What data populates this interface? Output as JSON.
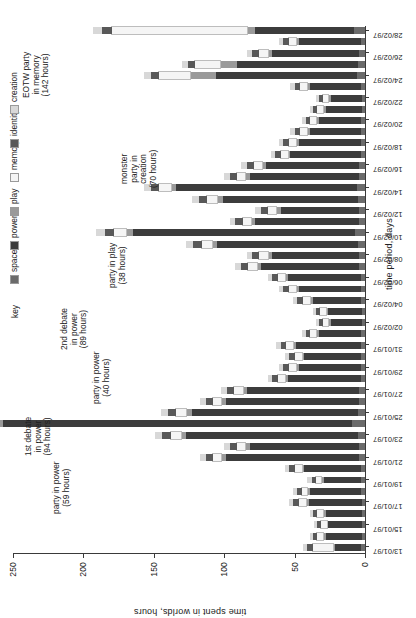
{
  "chart_data": {
    "type": "bar",
    "subtype": "stacked-bar",
    "orientation": "vertical-bars-rotated-page",
    "title": "",
    "xlabel": "time period, days",
    "ylabel": "time spent in worlds, hours",
    "ylim": [
      0,
      250
    ],
    "yticks": [
      0,
      50,
      100,
      150,
      200,
      250
    ],
    "grid": false,
    "legend_title": "key",
    "legend_position": "top-left-of-plot",
    "series": [
      {
        "name": "space",
        "color": "#6b6b6b"
      },
      {
        "name": "power",
        "color": "#3c3c3c"
      },
      {
        "name": "play",
        "color": "#9a9a9a"
      },
      {
        "name": "memory",
        "color": "#f5f5f5"
      },
      {
        "name": "identity",
        "color": "#585858"
      },
      {
        "name": "creation",
        "color": "#d8d8d8"
      }
    ],
    "categories": [
      "13/01/97",
      "14/01/97",
      "15/01/97",
      "16/01/97",
      "17/01/97",
      "18/01/97",
      "19/01/97",
      "20/01/97",
      "21/01/97",
      "22/01/97",
      "23/01/97",
      "24/01/97",
      "25/01/97",
      "26/01/97",
      "27/01/97",
      "28/01/97",
      "29/01/97",
      "30/01/97",
      "31/01/97",
      "01/02/97",
      "02/02/97",
      "03/02/97",
      "04/02/97",
      "05/02/97",
      "06/02/97",
      "07/02/97",
      "08/02/97",
      "09/02/97",
      "10/02/97",
      "11/02/97",
      "12/02/97",
      "13/02/97",
      "14/02/97",
      "15/02/97",
      "16/02/97",
      "17/02/97",
      "18/02/97",
      "19/02/97",
      "20/02/97",
      "21/02/97",
      "22/02/97",
      "23/02/97",
      "24/02/97",
      "25/02/97",
      "26/02/97",
      "27/02/97",
      "28/02/97"
    ],
    "tick_labels": [
      "13/01/97",
      "15/01/97",
      "17/01/97",
      "19/01/97",
      "21/01/97",
      "23/01/97",
      "25/01/97",
      "27/01/97",
      "29/01/97",
      "31/01/97",
      "02/02/97",
      "04/02/97",
      "06/02/97",
      "08/02/97",
      "10/02/97",
      "12/02/97",
      "14/02/97",
      "16/02/97",
      "18/02/97",
      "20/02/97",
      "22/02/97",
      "24/02/97",
      "26/02/97",
      "28/02/97"
    ],
    "tick_every": 2,
    "values": [
      [
        3,
        18,
        2,
        14,
        4,
        3
      ],
      [
        2,
        26,
        2,
        4,
        3,
        2
      ],
      [
        2,
        24,
        1,
        4,
        3,
        2
      ],
      [
        2,
        26,
        2,
        4,
        3,
        2
      ],
      [
        2,
        38,
        2,
        5,
        4,
        3
      ],
      [
        3,
        36,
        2,
        4,
        3,
        3
      ],
      [
        3,
        26,
        2,
        4,
        3,
        3
      ],
      [
        3,
        40,
        2,
        5,
        4,
        3
      ],
      [
        4,
        95,
        3,
        6,
        5,
        4
      ],
      [
        4,
        78,
        3,
        6,
        5,
        4
      ],
      [
        5,
        122,
        4,
        7,
        6,
        5
      ],
      [
        9,
        248,
        5,
        8,
        7,
        6
      ],
      [
        5,
        118,
        4,
        7,
        6,
        5
      ],
      [
        4,
        95,
        3,
        6,
        5,
        4
      ],
      [
        4,
        80,
        3,
        6,
        5,
        4
      ],
      [
        3,
        52,
        2,
        5,
        4,
        3
      ],
      [
        3,
        44,
        2,
        5,
        4,
        3
      ],
      [
        3,
        40,
        2,
        5,
        4,
        3
      ],
      [
        3,
        46,
        2,
        5,
        4,
        3
      ],
      [
        3,
        30,
        2,
        4,
        3,
        3
      ],
      [
        2,
        22,
        2,
        4,
        3,
        2
      ],
      [
        2,
        24,
        2,
        4,
        3,
        2
      ],
      [
        3,
        34,
        2,
        5,
        4,
        3
      ],
      [
        3,
        44,
        2,
        5,
        4,
        3
      ],
      [
        3,
        52,
        2,
        5,
        4,
        3
      ],
      [
        4,
        70,
        3,
        6,
        5,
        4
      ],
      [
        4,
        62,
        3,
        6,
        5,
        4
      ],
      [
        5,
        100,
        4,
        7,
        6,
        5
      ],
      [
        7,
        158,
        5,
        8,
        7,
        6
      ],
      [
        4,
        74,
        3,
        6,
        5,
        4
      ],
      [
        4,
        56,
        3,
        6,
        5,
        4
      ],
      [
        5,
        96,
        4,
        7,
        6,
        5
      ],
      [
        6,
        128,
        4,
        8,
        6,
        5
      ],
      [
        4,
        78,
        3,
        6,
        5,
        4
      ],
      [
        4,
        66,
        3,
        6,
        5,
        4
      ],
      [
        3,
        50,
        2,
        5,
        4,
        3
      ],
      [
        3,
        44,
        2,
        5,
        4,
        3
      ],
      [
        3,
        36,
        2,
        5,
        4,
        3
      ],
      [
        3,
        30,
        2,
        4,
        3,
        3
      ],
      [
        2,
        26,
        2,
        4,
        3,
        2
      ],
      [
        2,
        22,
        2,
        4,
        3,
        2
      ],
      [
        3,
        36,
        2,
        5,
        4,
        3
      ],
      [
        6,
        100,
        18,
        22,
        6,
        5
      ],
      [
        5,
        86,
        12,
        18,
        5,
        4
      ],
      [
        4,
        62,
        3,
        6,
        5,
        4
      ],
      [
        3,
        44,
        2,
        5,
        4,
        3
      ],
      [
        8,
        70,
        6,
        96,
        7,
        6
      ]
    ],
    "annotations": [
      {
        "id": "party-in-power-59",
        "text": "party in power\n(59 hours)"
      },
      {
        "id": "first-debate-94",
        "text": "1st debate\nin power\n(94 hours)"
      },
      {
        "id": "party-in-power-40",
        "text": "party in power\n(40 hours)"
      },
      {
        "id": "second-debate-89",
        "text": "2nd debate\nin power\n(89 hours)"
      },
      {
        "id": "party-in-play-38",
        "text": "party in play\n(38 hours)"
      },
      {
        "id": "monster-party-70",
        "text": "monster\nparty in\ncreation\n(70 hours)"
      },
      {
        "id": "eotw-party-142",
        "text": "EOTW party\nin memory\n(142 hours)"
      }
    ]
  }
}
